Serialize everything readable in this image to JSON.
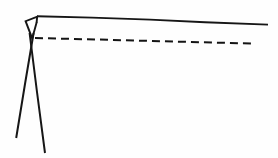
{
  "figure": {
    "title": "Line art schematic",
    "background_color": "#fefefe",
    "ink_color": "#161616",
    "width": 278,
    "height": 158
  },
  "elements": {
    "top_solid_line": {
      "name": "solid horizontal line",
      "style": "solid",
      "stroke_width": 1.9,
      "points": [
        [
          37.0,
          16.2
        ],
        [
          92.0,
          17.6
        ],
        [
          150.0,
          19.6
        ],
        [
          205.0,
          22.2
        ],
        [
          268.0,
          24.6
        ]
      ]
    },
    "dashed_line": {
      "name": "dashed horizontal line",
      "style": "dashed",
      "stroke_width": 2.0,
      "dash_length": 8,
      "gap_length": 5,
      "points": [
        [
          35.0,
          38.0
        ],
        [
          100.0,
          39.6
        ],
        [
          175.0,
          41.6
        ],
        [
          255.0,
          43.6
        ]
      ]
    },
    "wedge": {
      "name": "triangular wedge",
      "style": "solid",
      "stroke_width": 1.9,
      "points": [
        [
          37.4,
          16.6
        ],
        [
          25.6,
          21.2
        ],
        [
          32.2,
          38.4
        ],
        [
          36.6,
          22.4
        ]
      ]
    },
    "left_leg": {
      "name": "left splayed leg",
      "style": "solid",
      "stroke_width": 2.0,
      "points": [
        [
          33.6,
          33.0
        ],
        [
          25.0,
          84.0
        ],
        [
          16.2,
          138.0
        ]
      ]
    },
    "right_leg": {
      "name": "right splayed leg",
      "style": "solid",
      "stroke_width": 2.0,
      "points": [
        [
          29.6,
          33.0
        ],
        [
          37.0,
          92.0
        ],
        [
          45.0,
          153.0
        ]
      ]
    },
    "solid_line_start_tick": {
      "name": "short vertical tick at solid line start",
      "style": "solid",
      "stroke_width": 1.9,
      "points": [
        [
          37.2,
          16.2
        ],
        [
          36.6,
          22.6
        ]
      ]
    }
  }
}
